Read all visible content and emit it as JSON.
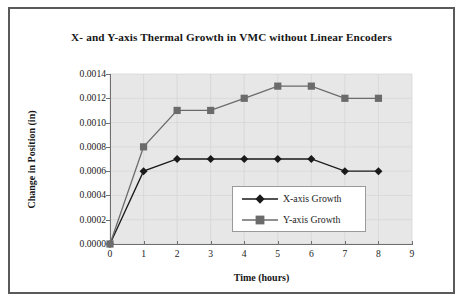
{
  "chart_data": {
    "type": "line",
    "title": "X- and Y-axis Thermal Growth in VMC without Linear Encoders",
    "xlabel": "Time (hours)",
    "ylabel": "Change in Position (in)",
    "x": [
      0,
      1,
      2,
      3,
      4,
      5,
      6,
      7,
      8
    ],
    "xlim": [
      0,
      9
    ],
    "ylim": [
      0.0,
      0.0014
    ],
    "xticks": [
      "0",
      "1",
      "2",
      "3",
      "4",
      "5",
      "6",
      "7",
      "8",
      "9"
    ],
    "xtick_values": [
      0,
      1,
      2,
      3,
      4,
      5,
      6,
      7,
      8,
      9
    ],
    "yticks": [
      "0.0000",
      "0.0002",
      "0.0004",
      "0.0006",
      "0.0008",
      "0.0010",
      "0.0012",
      "0.0014"
    ],
    "ytick_values": [
      0.0,
      0.0002,
      0.0004,
      0.0006,
      0.0008,
      0.001,
      0.0012,
      0.0014
    ],
    "grid": true,
    "legend_position": "inside-center-lower",
    "series": [
      {
        "name": "X-axis Growth",
        "marker": "diamond",
        "color": "#1a1a1a",
        "values": [
          0.0,
          0.0006,
          0.0007,
          0.0007,
          0.0007,
          0.0007,
          0.0007,
          0.0006,
          0.0006
        ]
      },
      {
        "name": "Y-axis Growth",
        "marker": "square",
        "color": "#6b6b6b",
        "values": [
          0.0,
          0.0008,
          0.0011,
          0.0011,
          0.0012,
          0.0013,
          0.0013,
          0.0012,
          0.0012
        ]
      }
    ]
  },
  "colors": {
    "frame_border": "#5a5a5a",
    "plot_background": "#e7e7e7",
    "axis_line": "#6f6f6f",
    "gridline": "#d4d4d4",
    "legend_border": "#9a9a9a",
    "text": "#161616"
  }
}
